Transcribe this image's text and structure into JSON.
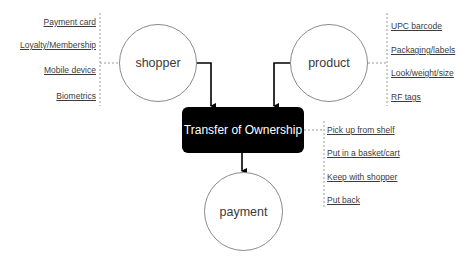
{
  "diagram": {
    "nodes": {
      "shopper": {
        "label": "shopper"
      },
      "product": {
        "label": "product"
      },
      "transfer": {
        "label": "Transfer of Ownership"
      },
      "payment": {
        "label": "payment"
      }
    },
    "shopper_attributes": [
      "Payment card",
      "Loyalty/Membership",
      "Mobile device",
      "Biometrics"
    ],
    "product_attributes": [
      "UPC barcode",
      "Packaging/labels",
      "Look/weight/size",
      "RF tags"
    ],
    "transfer_actions": [
      "Pick up from shelf",
      "Put in a basket/cart",
      "Keep with shopper",
      "Put back"
    ],
    "edges": [
      {
        "from": "shopper",
        "to": "transfer"
      },
      {
        "from": "product",
        "to": "transfer"
      },
      {
        "from": "transfer",
        "to": "payment"
      }
    ],
    "colors": {
      "box": "#000000",
      "box_text": "#ffffff",
      "circle_stroke": "#8a8a8a",
      "connector": "#000000",
      "dotted": "#9a9a9a"
    }
  }
}
